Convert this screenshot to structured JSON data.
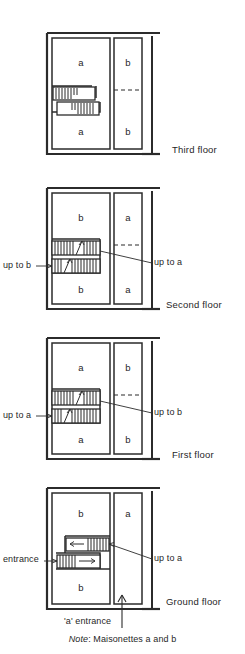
{
  "diagram": {
    "type": "architectural-floor-plans",
    "note": {
      "prefix": "Note",
      "text": "Maisonettes a and b"
    },
    "floors": [
      {
        "id": "third-floor",
        "caption": "Third floor",
        "units": {
          "top_left": "a",
          "top_right": "b",
          "bottom_left": "a",
          "bottom_right": "b"
        },
        "right_unit_divider": "dashed",
        "stairs": [
          {
            "id": "upper-flight",
            "direction": "none",
            "span": "partial"
          },
          {
            "id": "lower-flight",
            "direction": "none",
            "span": "partial"
          }
        ],
        "callouts": []
      },
      {
        "id": "second-floor",
        "caption": "Second floor",
        "units": {
          "top_left": "b",
          "top_right": "a",
          "bottom_left": "b",
          "bottom_right": "a"
        },
        "right_unit_divider": "dashed",
        "stairs": [
          {
            "id": "upper-flight",
            "direction": "up",
            "span": "full"
          },
          {
            "id": "lower-flight",
            "direction": "up",
            "span": "full"
          }
        ],
        "callouts": [
          {
            "id": "left-callout",
            "label": "up to b",
            "side": "left"
          },
          {
            "id": "right-callout",
            "label": "up to a",
            "side": "right"
          }
        ]
      },
      {
        "id": "first-floor",
        "caption": "First floor",
        "units": {
          "top_left": "a",
          "top_right": "b",
          "bottom_left": "a",
          "bottom_right": "b"
        },
        "right_unit_divider": "dashed",
        "stairs": [
          {
            "id": "upper-flight",
            "direction": "up",
            "span": "full"
          },
          {
            "id": "lower-flight",
            "direction": "up",
            "span": "full"
          }
        ],
        "callouts": [
          {
            "id": "left-callout",
            "label": "up to a",
            "side": "left"
          },
          {
            "id": "right-callout",
            "label": "up to b",
            "side": "right"
          }
        ]
      },
      {
        "id": "ground-floor",
        "caption": "Ground floor",
        "units": {
          "top_left": "b",
          "top_right": "a",
          "bottom_left": "b",
          "bottom_right": ""
        },
        "right_unit_divider": "none",
        "stairs": [
          {
            "id": "upper-flight",
            "direction": "left",
            "span": "half"
          },
          {
            "id": "lower-flight",
            "direction": "right",
            "span": "half"
          }
        ],
        "callouts": [
          {
            "id": "left-callout",
            "label": "entrance",
            "side": "left"
          },
          {
            "id": "right-callout",
            "label": "up to a",
            "side": "right"
          },
          {
            "id": "bottom-callout",
            "label": "'a' entrance",
            "side": "bottom"
          }
        ]
      }
    ],
    "colors": {
      "ink": "#1a1a1a",
      "paper": "#ffffff",
      "wall": "#2b2b2b"
    }
  }
}
